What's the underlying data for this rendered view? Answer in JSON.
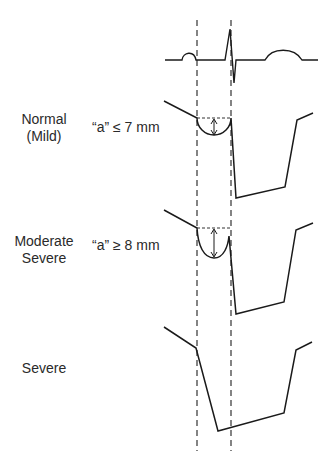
{
  "diagram": {
    "type": "echocardiographic waveform grading",
    "ecg": {
      "label": "ECG trace",
      "components": [
        "P wave",
        "QRS complex",
        "T wave"
      ]
    },
    "colors": {
      "line": "#1a1a1a",
      "text": "#2a2a2a",
      "background": "#ffffff"
    },
    "panels": [
      {
        "grade_line1": "Normal",
        "grade_line2": "(Mild)",
        "measurement": "“a” ≤ 7 mm"
      },
      {
        "grade_line1": "Moderate",
        "grade_line2": "Severe",
        "measurement": "“a” ≥ 8 mm"
      },
      {
        "grade_line1": "Severe",
        "grade_line2": "",
        "measurement": ""
      }
    ]
  }
}
